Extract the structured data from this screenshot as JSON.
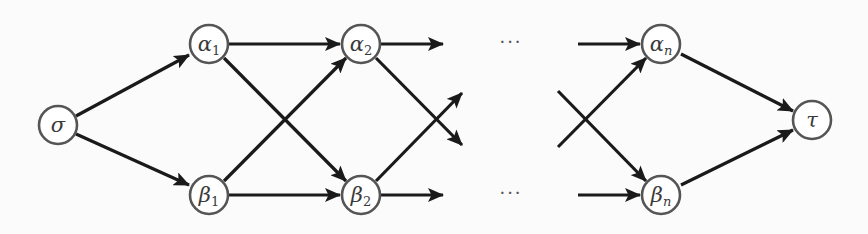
{
  "diagram": {
    "type": "directed-graph",
    "colors": {
      "edge": "#1a1a1a",
      "node_stroke": "#555555",
      "node_fill": "#ffffff",
      "label": "#3a3a3a"
    },
    "nodes": [
      {
        "id": "sigma",
        "symbol": "σ",
        "subscript": "",
        "x": 58,
        "y": 125
      },
      {
        "id": "alpha1",
        "symbol": "α",
        "subscript": "1",
        "x": 209,
        "y": 44
      },
      {
        "id": "beta1",
        "symbol": "β",
        "subscript": "1",
        "x": 209,
        "y": 195
      },
      {
        "id": "alpha2",
        "symbol": "α",
        "subscript": "2",
        "x": 361,
        "y": 44
      },
      {
        "id": "beta2",
        "symbol": "β",
        "subscript": "2",
        "x": 361,
        "y": 195
      },
      {
        "id": "alphan",
        "symbol": "α",
        "subscript": "n",
        "x": 661,
        "y": 44
      },
      {
        "id": "betan",
        "symbol": "β",
        "subscript": "n",
        "x": 661,
        "y": 195
      },
      {
        "id": "tau",
        "symbol": "τ",
        "subscript": "",
        "x": 812,
        "y": 120
      }
    ],
    "edges": [
      {
        "from": "sigma",
        "to": "alpha1"
      },
      {
        "from": "sigma",
        "to": "beta1"
      },
      {
        "from": "alpha1",
        "to": "alpha2"
      },
      {
        "from": "alpha1",
        "to": "beta2"
      },
      {
        "from": "beta1",
        "to": "alpha2"
      },
      {
        "from": "beta1",
        "to": "beta2"
      },
      {
        "from": "alpha2",
        "to": "…"
      },
      {
        "from": "alpha2",
        "to": "…(cross)"
      },
      {
        "from": "beta2",
        "to": "…"
      },
      {
        "from": "beta2",
        "to": "…(cross)"
      },
      {
        "from": "…",
        "to": "alphan"
      },
      {
        "from": "…(cross)",
        "to": "alphan"
      },
      {
        "from": "…",
        "to": "betan"
      },
      {
        "from": "…(cross)",
        "to": "betan"
      },
      {
        "from": "alphan",
        "to": "tau"
      },
      {
        "from": "betan",
        "to": "tau"
      }
    ],
    "ellipsis_top": "···",
    "ellipsis_bottom": "···"
  }
}
